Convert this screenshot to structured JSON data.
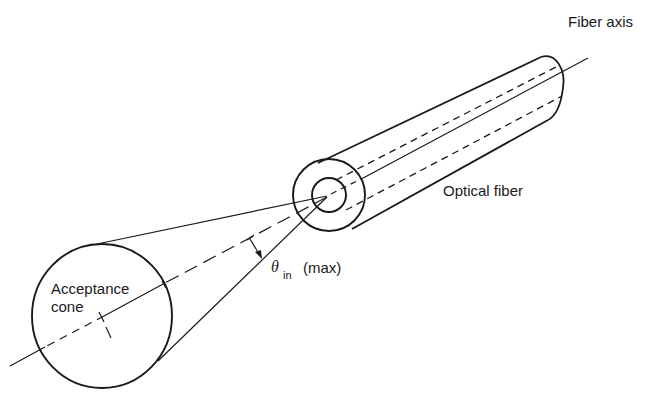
{
  "figure": {
    "type": "optical-fiber-acceptance-cone",
    "labels": {
      "fiber_axis": "Fiber axis",
      "optical_fiber": "Optical fiber",
      "acceptance_line1": "Acceptance",
      "acceptance_line2": "cone",
      "theta_symbol": "θ",
      "theta_subscript": "in",
      "theta_qualifier": "(max)"
    },
    "colors": {
      "ink": "#1a1a1a",
      "background": "#ffffff"
    }
  }
}
